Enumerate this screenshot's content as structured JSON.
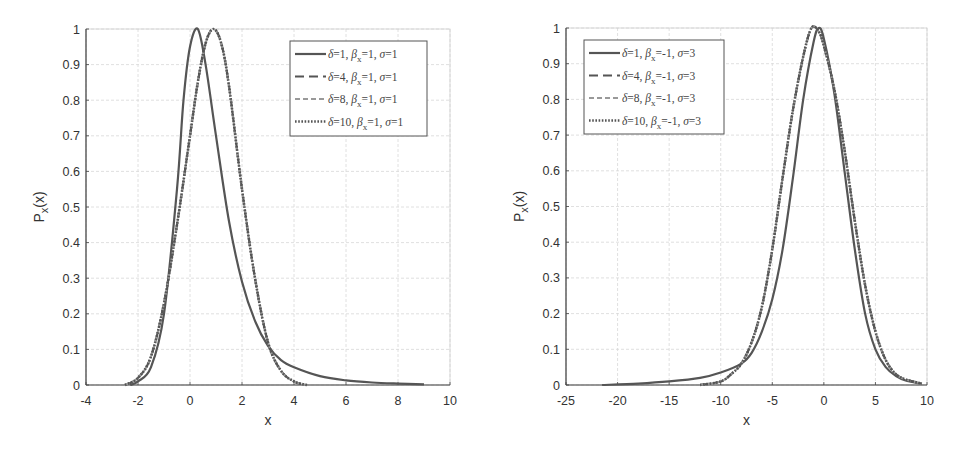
{
  "chart_data": [
    {
      "type": "line",
      "panel": "left",
      "title": "",
      "xlabel": "x",
      "ylabel": "P_x(x)",
      "xlim": [
        -4,
        10
      ],
      "ylim": [
        0,
        1
      ],
      "grid": true,
      "legend_position": "upper right",
      "xticks": [
        "-4",
        "-2",
        "0",
        "2",
        "4",
        "6",
        "8",
        "10"
      ],
      "yticks": [
        "0",
        "0.1",
        "0.2",
        "0.3",
        "0.4",
        "0.5",
        "0.6",
        "0.7",
        "0.8",
        "0.9",
        "1"
      ],
      "series": [
        {
          "name": "δ=1, β_x=1, σ=1",
          "style": "solid",
          "x": [
            -2.3,
            -2,
            -1.5,
            -1,
            -0.5,
            -0.25,
            0,
            0.3,
            0.6,
            1,
            1.5,
            2,
            2.5,
            3,
            3.5,
            4,
            5,
            6,
            7,
            8,
            9
          ],
          "y": [
            0.0,
            0.01,
            0.05,
            0.2,
            0.55,
            0.8,
            0.95,
            1.0,
            0.9,
            0.7,
            0.46,
            0.29,
            0.18,
            0.11,
            0.07,
            0.05,
            0.025,
            0.013,
            0.007,
            0.004,
            0.002
          ]
        },
        {
          "name": "δ=4, β_x=1, σ=1",
          "style": "dash-long",
          "x": [
            -2.5,
            -2,
            -1.5,
            -1,
            -0.5,
            0,
            0.3,
            0.6,
            0.9,
            1.2,
            1.5,
            2,
            2.5,
            3,
            3.5,
            4,
            4.5
          ],
          "y": [
            0.0,
            0.02,
            0.08,
            0.23,
            0.45,
            0.7,
            0.85,
            0.96,
            1.0,
            0.96,
            0.84,
            0.55,
            0.3,
            0.12,
            0.04,
            0.01,
            0.0
          ]
        },
        {
          "name": "δ=8, β_x=1, σ=1",
          "style": "dash-short",
          "x": [
            -2.5,
            -2,
            -1.5,
            -1,
            -0.5,
            0,
            0.3,
            0.6,
            0.9,
            1.2,
            1.5,
            2,
            2.5,
            3,
            3.5,
            4,
            4.5
          ],
          "y": [
            0.0,
            0.02,
            0.08,
            0.23,
            0.45,
            0.7,
            0.85,
            0.96,
            1.0,
            0.96,
            0.84,
            0.55,
            0.3,
            0.12,
            0.04,
            0.01,
            0.0
          ]
        },
        {
          "name": "δ=10, β_x=1, σ=1",
          "style": "dotted",
          "x": [
            -2.5,
            -2,
            -1.5,
            -1,
            -0.5,
            0,
            0.3,
            0.6,
            0.9,
            1.2,
            1.5,
            2,
            2.5,
            3,
            3.5,
            4,
            4.5
          ],
          "y": [
            0.0,
            0.02,
            0.08,
            0.23,
            0.45,
            0.7,
            0.85,
            0.96,
            1.0,
            0.96,
            0.84,
            0.55,
            0.3,
            0.12,
            0.04,
            0.01,
            0.0
          ]
        }
      ]
    },
    {
      "type": "line",
      "panel": "right",
      "title": "",
      "xlabel": "x",
      "ylabel": "P_x(x)",
      "xlim": [
        -25,
        10
      ],
      "ylim": [
        0,
        1
      ],
      "grid": true,
      "legend_position": "upper left",
      "xticks": [
        "-25",
        "-20",
        "-15",
        "-10",
        "-5",
        "0",
        "5",
        "10"
      ],
      "yticks": [
        "0",
        "0.1",
        "0.2",
        "0.3",
        "0.4",
        "0.5",
        "0.6",
        "0.7",
        "0.8",
        "0.9",
        "1"
      ],
      "series": [
        {
          "name": "δ=1, β_x=-1, σ=3",
          "style": "solid",
          "x": [
            -21.5,
            -18,
            -15,
            -12,
            -10,
            -8,
            -7,
            -6,
            -5,
            -4,
            -3,
            -2,
            -1,
            -0.5,
            0,
            1,
            2,
            3,
            4,
            5,
            6,
            7,
            8,
            9.5
          ],
          "y": [
            0.0,
            0.004,
            0.01,
            0.02,
            0.035,
            0.06,
            0.09,
            0.15,
            0.24,
            0.38,
            0.58,
            0.8,
            0.96,
            1.0,
            0.97,
            0.82,
            0.6,
            0.38,
            0.2,
            0.1,
            0.05,
            0.025,
            0.012,
            0.004
          ]
        },
        {
          "name": "δ=4, β_x=-1, σ=3",
          "style": "dash-long",
          "x": [
            -12,
            -10,
            -9,
            -8,
            -7,
            -6,
            -5,
            -4,
            -3,
            -2,
            -1.2,
            -0.5,
            0,
            1,
            2,
            3,
            4,
            5,
            6,
            7,
            8,
            9.5
          ],
          "y": [
            0.0,
            0.01,
            0.03,
            0.06,
            0.12,
            0.22,
            0.38,
            0.58,
            0.77,
            0.92,
            1.0,
            0.99,
            0.95,
            0.83,
            0.66,
            0.46,
            0.28,
            0.15,
            0.07,
            0.03,
            0.015,
            0.004
          ]
        },
        {
          "name": "δ=8, β_x=-1, σ=3",
          "style": "dash-short",
          "x": [
            -12,
            -10,
            -9,
            -8,
            -7,
            -6,
            -5,
            -4,
            -3,
            -2,
            -1.2,
            -0.5,
            0,
            1,
            2,
            3,
            4,
            5,
            6,
            7,
            8,
            9.5
          ],
          "y": [
            0.0,
            0.01,
            0.03,
            0.06,
            0.12,
            0.22,
            0.38,
            0.58,
            0.77,
            0.92,
            1.0,
            0.99,
            0.95,
            0.83,
            0.66,
            0.46,
            0.28,
            0.15,
            0.07,
            0.03,
            0.015,
            0.004
          ]
        },
        {
          "name": "δ=10, β_x=-1, σ=3",
          "style": "dotted",
          "x": [
            -12,
            -10,
            -9,
            -8,
            -7,
            -6,
            -5,
            -4,
            -3,
            -2,
            -1.2,
            -0.5,
            0,
            1,
            2,
            3,
            4,
            5,
            6,
            7,
            8,
            9.5
          ],
          "y": [
            0.0,
            0.01,
            0.03,
            0.06,
            0.12,
            0.22,
            0.38,
            0.58,
            0.77,
            0.92,
            1.0,
            0.99,
            0.95,
            0.83,
            0.66,
            0.46,
            0.28,
            0.15,
            0.07,
            0.03,
            0.015,
            0.004
          ]
        }
      ]
    }
  ],
  "legends": {
    "left": [
      {
        "delta": "1",
        "beta": "1",
        "sigma": "1"
      },
      {
        "delta": "4",
        "beta": "1",
        "sigma": "1"
      },
      {
        "delta": "8",
        "beta": "1",
        "sigma": "1"
      },
      {
        "delta": "10",
        "beta": "1",
        "sigma": "1"
      }
    ],
    "right": [
      {
        "delta": "1",
        "beta": "-1",
        "sigma": "3"
      },
      {
        "delta": "4",
        "beta": "-1",
        "sigma": "3"
      },
      {
        "delta": "8",
        "beta": "-1",
        "sigma": "3"
      },
      {
        "delta": "10",
        "beta": "-1",
        "sigma": "3"
      }
    ]
  },
  "colors": {
    "curve": "#555555",
    "curve_light": "#999999",
    "axis": "#444444",
    "grid": "#d8d8d8"
  }
}
